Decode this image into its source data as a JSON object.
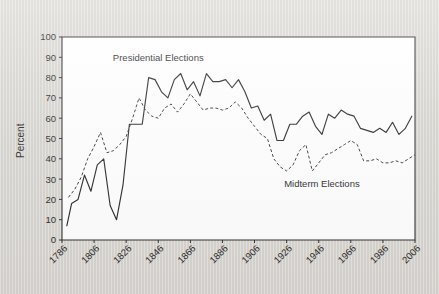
{
  "chart_data": {
    "type": "line",
    "title": "",
    "subtitle": "",
    "xlabel": "",
    "ylabel": "Percent",
    "xlim": [
      1786,
      2006
    ],
    "ylim": [
      0,
      100
    ],
    "grid": false,
    "legend_position": "inline-annotation",
    "y_ticks": [
      0,
      10,
      20,
      30,
      40,
      50,
      60,
      70,
      80,
      90,
      100
    ],
    "y_tick_labels": [
      "0",
      "10",
      "20",
      "30",
      "40",
      "50",
      "60",
      "70",
      "80",
      "90",
      "100"
    ],
    "x_ticks": [
      1786,
      1806,
      1826,
      1846,
      1866,
      1886,
      1906,
      1926,
      1946,
      1966,
      1986,
      2006
    ],
    "x_tick_labels": [
      "1786",
      "1806",
      "1826",
      "1846",
      "1866",
      "1886",
      "1906",
      "1926",
      "1946",
      "1966",
      "1986",
      "2006"
    ],
    "annotations": [
      {
        "text": "Presidential Elections",
        "x": 1846,
        "y": 88
      },
      {
        "text": "Midterm Elections",
        "x": 1948,
        "y": 26
      }
    ],
    "series": [
      {
        "name": "Presidential Elections",
        "style": "solid",
        "color": "#222222",
        "x": [
          1789,
          1792,
          1796,
          1800,
          1804,
          1808,
          1812,
          1816,
          1820,
          1824,
          1828,
          1832,
          1836,
          1840,
          1844,
          1848,
          1852,
          1856,
          1860,
          1864,
          1868,
          1872,
          1876,
          1880,
          1884,
          1888,
          1892,
          1896,
          1900,
          1904,
          1908,
          1912,
          1916,
          1920,
          1924,
          1928,
          1932,
          1936,
          1940,
          1944,
          1948,
          1952,
          1956,
          1960,
          1964,
          1968,
          1972,
          1976,
          1980,
          1984,
          1988,
          1992,
          1996,
          2000,
          2004
        ],
        "values": [
          7,
          18,
          20,
          32,
          24,
          37,
          40,
          17,
          10,
          27,
          57,
          57,
          57,
          80,
          79,
          73,
          70,
          79,
          82,
          74,
          78,
          71,
          82,
          78,
          78,
          79,
          75,
          79,
          73,
          65,
          66,
          59,
          62,
          49,
          49,
          57,
          57,
          61,
          63,
          56,
          52,
          62,
          60,
          64,
          62,
          61,
          55,
          54,
          53,
          55,
          53,
          58,
          52,
          55,
          61
        ]
      },
      {
        "name": "Midterm Elections",
        "style": "dashed",
        "color": "#333333",
        "x": [
          1790,
          1794,
          1798,
          1802,
          1806,
          1810,
          1814,
          1818,
          1822,
          1826,
          1830,
          1834,
          1838,
          1842,
          1846,
          1850,
          1854,
          1858,
          1862,
          1866,
          1870,
          1874,
          1878,
          1882,
          1886,
          1890,
          1894,
          1898,
          1902,
          1906,
          1910,
          1914,
          1918,
          1922,
          1926,
          1930,
          1934,
          1938,
          1942,
          1946,
          1950,
          1954,
          1958,
          1962,
          1966,
          1970,
          1974,
          1978,
          1982,
          1986,
          1990,
          1994,
          1998,
          2002,
          2006
        ],
        "values": [
          21,
          25,
          31,
          40,
          46,
          53,
          43,
          44,
          47,
          51,
          60,
          70,
          64,
          61,
          60,
          65,
          67,
          63,
          67,
          72,
          68,
          64,
          65,
          65,
          64,
          65,
          68,
          65,
          60,
          56,
          52,
          50,
          40,
          36,
          34,
          37,
          44,
          47,
          34,
          38,
          42,
          43,
          45,
          47,
          49,
          47,
          39,
          39,
          40,
          38,
          38,
          39,
          38,
          40,
          42
        ]
      }
    ]
  },
  "figure": {
    "background_color": "#d9d9d6",
    "plot_background_color": "#ffffff",
    "frame_color": "#2b2b2b"
  }
}
